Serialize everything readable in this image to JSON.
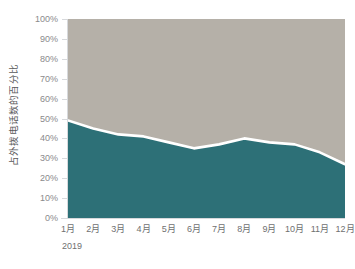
{
  "chart_data": {
    "type": "area",
    "title": "",
    "subtitle": "",
    "xlabel": "",
    "ylabel": "占外拨电话数的百分比",
    "categories": [
      "1月",
      "2月",
      "3月",
      "4月",
      "5月",
      "6月",
      "7月",
      "8月",
      "9月",
      "10月",
      "11月",
      "12月"
    ],
    "ylim": [
      0,
      100
    ],
    "yticks": [
      0,
      10,
      20,
      30,
      40,
      50,
      60,
      70,
      80,
      90,
      100
    ],
    "ytick_labels": [
      "0%",
      "10%",
      "20%",
      "30%",
      "40%",
      "50%",
      "60%",
      "70%",
      "80%",
      "90%",
      "100%"
    ],
    "stacked": true,
    "grid": false,
    "legend": false,
    "legend_position": "none",
    "series": [
      {
        "name": "teal-band",
        "color": "#2d7077",
        "values": [
          49,
          45,
          42,
          41,
          38,
          35,
          37,
          40,
          38,
          37,
          33,
          27
        ]
      },
      {
        "name": "gray-band",
        "color": "#b5b0a8",
        "values": [
          51,
          55,
          58,
          59,
          62,
          65,
          63,
          60,
          62,
          63,
          67,
          73
        ]
      }
    ],
    "boundary_stroke": "#ffffff",
    "period_caption": "2019"
  },
  "axis": {
    "y_title": "占外拨电话数的百分比",
    "y_labels": [
      "100%",
      "90%",
      "80%",
      "70%",
      "60%",
      "50%",
      "40%",
      "30%",
      "20%",
      "10%",
      "0%"
    ],
    "x_labels": [
      "1月",
      "2月",
      "3月",
      "4月",
      "5月",
      "6月",
      "7月",
      "8月",
      "9月",
      "10月",
      "11月",
      "12月"
    ]
  },
  "caption": {
    "period": "2019"
  },
  "colors": {
    "teal": "#2d7077",
    "gray": "#b5b0a8",
    "boundary": "#ffffff",
    "axis_line": "#d7d9dc",
    "tick_text": "#8a8a8c",
    "x_tick_text": "#6f6f71",
    "y_title_text": "#59595b",
    "background": "#ffffff"
  }
}
